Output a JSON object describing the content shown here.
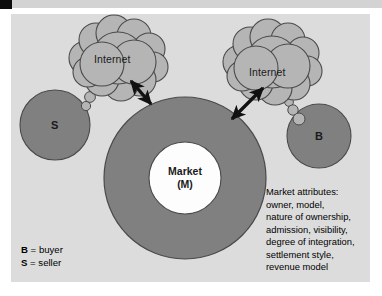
{
  "diagram": {
    "background_color": "#dcdcdc",
    "node_fill": "#808080",
    "cloud_fill": "#b5b5b5",
    "core_fill": "#fdfdfd",
    "stroke_color": "#4a4a4a",
    "arrow_color": "#111111"
  },
  "clouds": [
    {
      "label": "Internet",
      "side": "left"
    },
    {
      "label": "Internet",
      "side": "right"
    }
  ],
  "nodes": {
    "seller": {
      "label": "S"
    },
    "buyer": {
      "label": "B"
    },
    "market": {
      "line1": "Market",
      "line2": "(M)"
    }
  },
  "legend": {
    "items": [
      {
        "key": "B",
        "eq": " = ",
        "value": "buyer"
      },
      {
        "key": "S",
        "eq": " = ",
        "value": "seller"
      }
    ]
  },
  "attributes": {
    "heading": "Market attributes:",
    "lines": [
      "owner, model,",
      "nature of ownership,",
      "admission, visibility,",
      "degree of integration,",
      "settlement style,",
      "revenue model"
    ]
  }
}
